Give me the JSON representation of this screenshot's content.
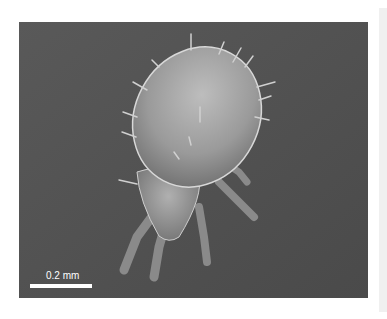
{
  "image": {
    "subject": "SEM micrograph of a mite",
    "background_color": "#555555",
    "scale_bar": {
      "label": "0.2 mm",
      "color": "#ffffff"
    }
  },
  "scrollbar": {
    "color": "#f0f0f0"
  }
}
